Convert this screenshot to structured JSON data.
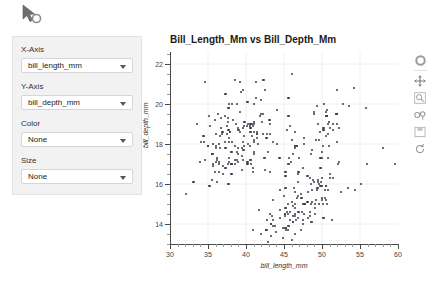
{
  "cursor": {
    "icon": "mouse-pointer-loading-icon"
  },
  "panel": {
    "fields": [
      {
        "label": "X-Axis",
        "value": "bill_length_mm",
        "name": "x-axis"
      },
      {
        "label": "Y-Axis",
        "value": "bill_depth_mm",
        "name": "y-axis"
      },
      {
        "label": "Color",
        "value": "None",
        "name": "color"
      },
      {
        "label": "Size",
        "value": "None",
        "name": "size"
      }
    ]
  },
  "toolbar": {
    "tools": [
      {
        "name": "bokeh-logo-icon",
        "label": "Bokeh"
      },
      {
        "name": "pan-tool-icon",
        "label": "Pan"
      },
      {
        "name": "box-zoom-icon",
        "label": "Box Zoom"
      },
      {
        "name": "wheel-zoom-icon",
        "label": "Wheel Zoom"
      },
      {
        "name": "save-icon",
        "label": "Save"
      },
      {
        "name": "reset-icon",
        "label": "Reset"
      }
    ]
  },
  "chart_data": {
    "type": "scatter",
    "title": "Bill_Length_Mm vs Bill_Depth_Mm",
    "xlabel": "bill_length_mm",
    "ylabel": "bill_depth_mm",
    "xlim": [
      30,
      60
    ],
    "ylim": [
      13,
      22.6
    ],
    "xticks": [
      30,
      35,
      40,
      45,
      50,
      55,
      60
    ],
    "yticks": [
      14,
      16,
      18,
      20,
      22
    ],
    "grid": true,
    "legend": null,
    "marker_color": "#3b3b4a",
    "points": [
      [
        39.1,
        18.7
      ],
      [
        39.5,
        17.4
      ],
      [
        40.3,
        18.0
      ],
      [
        36.7,
        19.3
      ],
      [
        39.3,
        20.6
      ],
      [
        38.9,
        17.8
      ],
      [
        39.2,
        19.6
      ],
      [
        34.1,
        18.1
      ],
      [
        42.0,
        20.2
      ],
      [
        37.8,
        17.1
      ],
      [
        37.8,
        17.3
      ],
      [
        41.1,
        17.6
      ],
      [
        38.6,
        21.2
      ],
      [
        34.6,
        21.1
      ],
      [
        36.6,
        17.8
      ],
      [
        38.7,
        19.0
      ],
      [
        42.5,
        20.7
      ],
      [
        34.4,
        18.4
      ],
      [
        46.0,
        21.5
      ],
      [
        37.8,
        18.3
      ],
      [
        37.7,
        18.7
      ],
      [
        35.9,
        19.2
      ],
      [
        38.2,
        18.1
      ],
      [
        38.8,
        17.2
      ],
      [
        35.3,
        18.9
      ],
      [
        40.6,
        18.6
      ],
      [
        40.5,
        17.9
      ],
      [
        37.9,
        18.6
      ],
      [
        40.5,
        18.9
      ],
      [
        39.5,
        16.7
      ],
      [
        37.2,
        18.1
      ],
      [
        39.5,
        17.8
      ],
      [
        40.9,
        18.9
      ],
      [
        36.4,
        17.0
      ],
      [
        39.2,
        21.1
      ],
      [
        38.8,
        20.0
      ],
      [
        42.2,
        18.5
      ],
      [
        37.6,
        19.3
      ],
      [
        39.8,
        19.1
      ],
      [
        36.5,
        18.0
      ],
      [
        40.8,
        18.4
      ],
      [
        36.0,
        18.5
      ],
      [
        44.1,
        19.7
      ],
      [
        37.0,
        16.9
      ],
      [
        39.6,
        18.8
      ],
      [
        41.1,
        19.0
      ],
      [
        37.5,
        18.9
      ],
      [
        36.0,
        17.9
      ],
      [
        42.3,
        21.2
      ],
      [
        39.6,
        17.7
      ],
      [
        40.1,
        18.9
      ],
      [
        35.0,
        17.9
      ],
      [
        42.0,
        19.5
      ],
      [
        34.5,
        18.1
      ],
      [
        41.4,
        18.6
      ],
      [
        39.0,
        17.5
      ],
      [
        40.6,
        18.8
      ],
      [
        36.5,
        16.6
      ],
      [
        37.6,
        19.1
      ],
      [
        35.7,
        16.9
      ],
      [
        41.3,
        21.1
      ],
      [
        37.6,
        17.0
      ],
      [
        41.1,
        18.2
      ],
      [
        36.4,
        17.1
      ],
      [
        41.6,
        18.0
      ],
      [
        35.5,
        16.2
      ],
      [
        41.1,
        19.1
      ],
      [
        35.9,
        16.6
      ],
      [
        41.8,
        19.4
      ],
      [
        33.5,
        19.0
      ],
      [
        39.7,
        18.4
      ],
      [
        39.6,
        17.2
      ],
      [
        45.8,
        18.9
      ],
      [
        35.5,
        17.5
      ],
      [
        42.8,
        18.5
      ],
      [
        40.9,
        16.8
      ],
      [
        37.2,
        19.4
      ],
      [
        36.2,
        16.1
      ],
      [
        42.1,
        19.1
      ],
      [
        34.6,
        17.2
      ],
      [
        42.9,
        17.6
      ],
      [
        36.7,
        18.8
      ],
      [
        35.1,
        19.4
      ],
      [
        37.3,
        17.8
      ],
      [
        41.3,
        20.3
      ],
      [
        36.3,
        19.5
      ],
      [
        36.9,
        18.6
      ],
      [
        38.3,
        19.2
      ],
      [
        38.9,
        18.8
      ],
      [
        35.7,
        18.0
      ],
      [
        41.1,
        18.1
      ],
      [
        34.0,
        17.1
      ],
      [
        39.6,
        18.1
      ],
      [
        36.2,
        17.3
      ],
      [
        40.8,
        19.0
      ],
      [
        38.1,
        17.0
      ],
      [
        40.3,
        19.0
      ],
      [
        33.1,
        16.1
      ],
      [
        43.2,
        19.0
      ],
      [
        35.0,
        17.9
      ],
      [
        41.0,
        20.0
      ],
      [
        37.7,
        16.0
      ],
      [
        37.8,
        20.0
      ],
      [
        37.9,
        18.6
      ],
      [
        39.7,
        18.9
      ],
      [
        38.6,
        17.2
      ],
      [
        38.2,
        20.0
      ],
      [
        38.1,
        17.0
      ],
      [
        43.2,
        18.5
      ],
      [
        38.1,
        16.5
      ],
      [
        45.6,
        20.3
      ],
      [
        39.7,
        17.7
      ],
      [
        42.2,
        19.5
      ],
      [
        39.6,
        20.7
      ],
      [
        42.7,
        18.3
      ],
      [
        38.6,
        17.0
      ],
      [
        37.3,
        20.5
      ],
      [
        35.7,
        17.0
      ],
      [
        41.1,
        18.6
      ],
      [
        36.2,
        17.2
      ],
      [
        37.7,
        19.8
      ],
      [
        40.2,
        17.0
      ],
      [
        41.4,
        18.5
      ],
      [
        35.2,
        15.9
      ],
      [
        40.6,
        19.0
      ],
      [
        38.8,
        17.6
      ],
      [
        41.5,
        18.3
      ],
      [
        39.0,
        17.1
      ],
      [
        44.1,
        18.0
      ],
      [
        38.5,
        17.9
      ],
      [
        43.1,
        19.2
      ],
      [
        36.8,
        18.5
      ],
      [
        37.5,
        18.5
      ],
      [
        38.1,
        17.6
      ],
      [
        41.1,
        17.5
      ],
      [
        35.6,
        17.5
      ],
      [
        40.2,
        20.1
      ],
      [
        37.0,
        16.5
      ],
      [
        39.7,
        17.9
      ],
      [
        40.2,
        17.1
      ],
      [
        40.6,
        17.2
      ],
      [
        32.1,
        15.5
      ],
      [
        40.7,
        17.0
      ],
      [
        37.3,
        16.8
      ],
      [
        39.0,
        18.7
      ],
      [
        39.2,
        18.6
      ],
      [
        36.6,
        18.4
      ],
      [
        36.0,
        17.8
      ],
      [
        37.8,
        18.1
      ],
      [
        36.0,
        17.1
      ],
      [
        41.5,
        18.5
      ],
      [
        46.1,
        13.2
      ],
      [
        50.0,
        16.3
      ],
      [
        48.7,
        14.1
      ],
      [
        50.0,
        15.2
      ],
      [
        47.6,
        14.5
      ],
      [
        46.5,
        13.5
      ],
      [
        45.4,
        14.6
      ],
      [
        46.7,
        15.3
      ],
      [
        43.3,
        13.4
      ],
      [
        46.8,
        15.4
      ],
      [
        40.9,
        13.7
      ],
      [
        49.0,
        16.1
      ],
      [
        45.5,
        13.7
      ],
      [
        48.4,
        14.6
      ],
      [
        45.8,
        14.6
      ],
      [
        49.3,
        15.7
      ],
      [
        42.0,
        13.5
      ],
      [
        49.2,
        15.2
      ],
      [
        46.2,
        14.9
      ],
      [
        48.7,
        15.1
      ],
      [
        50.2,
        14.3
      ],
      [
        45.1,
        14.5
      ],
      [
        46.5,
        14.5
      ],
      [
        46.3,
        15.8
      ],
      [
        42.9,
        13.1
      ],
      [
        46.1,
        15.1
      ],
      [
        44.5,
        14.3
      ],
      [
        47.8,
        15.0
      ],
      [
        48.2,
        14.3
      ],
      [
        50.0,
        15.3
      ],
      [
        47.3,
        15.3
      ],
      [
        42.8,
        14.2
      ],
      [
        45.1,
        14.5
      ],
      [
        59.6,
        17.0
      ],
      [
        49.1,
        14.8
      ],
      [
        48.4,
        16.3
      ],
      [
        42.6,
        13.7
      ],
      [
        44.4,
        17.3
      ],
      [
        44.0,
        13.6
      ],
      [
        48.7,
        15.7
      ],
      [
        42.7,
        13.7
      ],
      [
        49.6,
        16.0
      ],
      [
        45.3,
        13.7
      ],
      [
        49.6,
        15.0
      ],
      [
        50.5,
        15.9
      ],
      [
        43.6,
        13.9
      ],
      [
        45.5,
        13.9
      ],
      [
        50.5,
        15.9
      ],
      [
        44.9,
        13.3
      ],
      [
        45.2,
        15.8
      ],
      [
        46.6,
        14.2
      ],
      [
        48.5,
        14.1
      ],
      [
        45.1,
        14.4
      ],
      [
        50.1,
        15.0
      ],
      [
        46.5,
        14.4
      ],
      [
        45.0,
        15.4
      ],
      [
        43.8,
        13.9
      ],
      [
        45.5,
        15.0
      ],
      [
        43.2,
        14.5
      ],
      [
        50.4,
        15.3
      ],
      [
        45.3,
        13.8
      ],
      [
        46.2,
        14.1
      ],
      [
        45.7,
        13.9
      ],
      [
        54.3,
        15.7
      ],
      [
        45.8,
        14.2
      ],
      [
        49.8,
        16.8
      ],
      [
        46.2,
        14.4
      ],
      [
        49.5,
        16.2
      ],
      [
        43.5,
        14.2
      ],
      [
        50.7,
        15.0
      ],
      [
        47.7,
        15.0
      ],
      [
        46.4,
        15.6
      ],
      [
        48.2,
        15.6
      ],
      [
        46.5,
        14.8
      ],
      [
        46.4,
        15.0
      ],
      [
        48.6,
        16.0
      ],
      [
        47.5,
        14.2
      ],
      [
        51.1,
        16.3
      ],
      [
        45.2,
        13.8
      ],
      [
        45.2,
        16.4
      ],
      [
        49.1,
        14.5
      ],
      [
        52.5,
        15.6
      ],
      [
        47.4,
        14.6
      ],
      [
        50.0,
        15.9
      ],
      [
        44.9,
        13.8
      ],
      [
        50.8,
        17.3
      ],
      [
        43.4,
        14.4
      ],
      [
        51.3,
        14.2
      ],
      [
        47.5,
        14.0
      ],
      [
        52.1,
        17.0
      ],
      [
        47.5,
        15.0
      ],
      [
        52.2,
        17.1
      ],
      [
        45.5,
        14.5
      ],
      [
        49.5,
        16.1
      ],
      [
        44.5,
        14.7
      ],
      [
        50.8,
        15.7
      ],
      [
        49.4,
        15.8
      ],
      [
        46.9,
        14.6
      ],
      [
        48.4,
        14.4
      ],
      [
        51.1,
        16.5
      ],
      [
        48.5,
        15.0
      ],
      [
        55.9,
        17.0
      ],
      [
        47.2,
        15.5
      ],
      [
        49.1,
        15.0
      ],
      [
        46.8,
        16.1
      ],
      [
        41.7,
        14.7
      ],
      [
        53.4,
        15.8
      ],
      [
        43.3,
        14.0
      ],
      [
        48.1,
        15.1
      ],
      [
        50.5,
        15.2
      ],
      [
        49.8,
        15.9
      ],
      [
        43.5,
        15.2
      ],
      [
        51.5,
        16.3
      ],
      [
        46.2,
        14.1
      ],
      [
        55.1,
        16.0
      ],
      [
        44.5,
        15.7
      ],
      [
        48.8,
        16.2
      ],
      [
        47.2,
        13.7
      ],
      [
        46.8,
        14.3
      ],
      [
        50.4,
        15.7
      ],
      [
        45.2,
        14.8
      ],
      [
        49.9,
        16.1
      ],
      [
        46.1,
        18.2
      ],
      [
        50.0,
        17.3
      ],
      [
        48.7,
        17.7
      ],
      [
        50.0,
        17.6
      ],
      [
        47.6,
        18.0
      ],
      [
        46.5,
        17.9
      ],
      [
        45.4,
        18.7
      ],
      [
        46.7,
        17.9
      ],
      [
        43.3,
        14.0
      ],
      [
        50.6,
        19.4
      ],
      [
        51.9,
        19.5
      ],
      [
        46.5,
        17.9
      ],
      [
        47.0,
        17.3
      ],
      [
        52.0,
        18.1
      ],
      [
        45.9,
        17.1
      ],
      [
        50.5,
        19.6
      ],
      [
        50.3,
        20.0
      ],
      [
        58.0,
        17.8
      ],
      [
        46.4,
        18.6
      ],
      [
        49.2,
        18.2
      ],
      [
        42.4,
        17.3
      ],
      [
        48.5,
        17.5
      ],
      [
        43.2,
        16.6
      ],
      [
        50.6,
        19.4
      ],
      [
        46.7,
        17.9
      ],
      [
        52.0,
        19.0
      ],
      [
        50.5,
        18.4
      ],
      [
        49.5,
        19.0
      ],
      [
        46.4,
        17.8
      ],
      [
        52.8,
        20.0
      ],
      [
        40.9,
        16.6
      ],
      [
        54.2,
        20.8
      ],
      [
        42.5,
        16.7
      ],
      [
        51.0,
        18.8
      ],
      [
        49.7,
        18.6
      ],
      [
        47.5,
        16.8
      ],
      [
        47.6,
        18.3
      ],
      [
        52.0,
        20.7
      ],
      [
        46.9,
        16.6
      ],
      [
        53.5,
        19.9
      ],
      [
        49.0,
        19.5
      ],
      [
        46.2,
        17.5
      ],
      [
        50.9,
        19.1
      ],
      [
        45.5,
        17.0
      ],
      [
        50.9,
        17.9
      ],
      [
        50.8,
        18.5
      ],
      [
        50.1,
        17.9
      ],
      [
        49.0,
        19.6
      ],
      [
        51.5,
        18.7
      ],
      [
        49.8,
        17.3
      ],
      [
        48.1,
        16.4
      ],
      [
        51.4,
        19.0
      ],
      [
        45.7,
        17.3
      ],
      [
        50.7,
        19.7
      ],
      [
        42.5,
        17.3
      ],
      [
        52.2,
        18.8
      ],
      [
        45.2,
        16.6
      ],
      [
        49.3,
        19.9
      ],
      [
        50.2,
        18.8
      ],
      [
        45.6,
        19.4
      ],
      [
        51.9,
        19.5
      ],
      [
        46.8,
        16.5
      ],
      [
        45.7,
        17.0
      ],
      [
        55.8,
        19.8
      ],
      [
        43.5,
        18.1
      ],
      [
        49.6,
        18.2
      ],
      [
        50.8,
        19.0
      ],
      [
        50.2,
        18.7
      ]
    ]
  }
}
